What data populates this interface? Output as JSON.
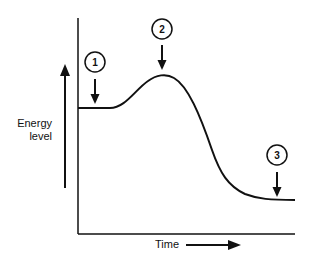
{
  "diagram": {
    "type": "energy-level-curve",
    "y_axis_label_line1": "Energy",
    "y_axis_label_line2": "level",
    "x_axis_label": "Time",
    "markers": [
      {
        "id": "1",
        "label": "1",
        "position": "initial plateau"
      },
      {
        "id": "2",
        "label": "2",
        "position": "peak"
      },
      {
        "id": "3",
        "label": "3",
        "position": "final plateau"
      }
    ],
    "colors": {
      "line": "#111111",
      "background": "#ffffff"
    }
  }
}
